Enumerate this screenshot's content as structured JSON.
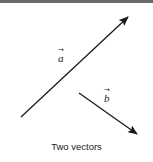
{
  "figure": {
    "caption": "Two vectors",
    "vectors": [
      {
        "name": "a",
        "label": "a",
        "accent": "→",
        "start": [
          21,
          117
        ],
        "end": [
          128,
          17
        ],
        "color": "#1a1a1a"
      },
      {
        "name": "b",
        "label": "b",
        "accent": "→",
        "start": [
          79,
          93
        ],
        "end": [
          137,
          134
        ],
        "color": "#1a1a1a"
      }
    ],
    "border_color": "#6a6a6a"
  }
}
